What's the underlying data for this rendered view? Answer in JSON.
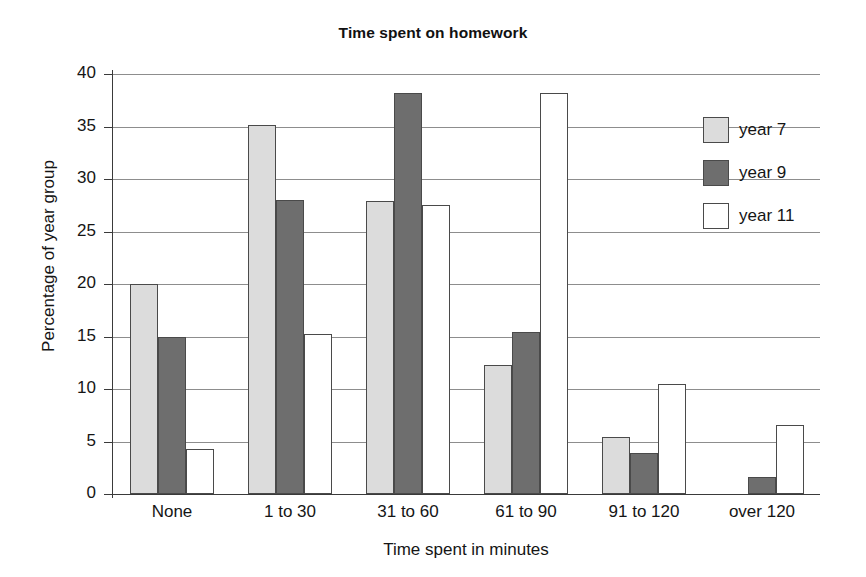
{
  "chart_data": {
    "type": "bar",
    "title": "Time spent on homework",
    "xlabel": "Time spent in minutes",
    "ylabel": "Percentage of year group",
    "categories": [
      "None",
      "1 to 30",
      "31 to 60",
      "61 to 90",
      "91 to 120",
      "over 120"
    ],
    "series": [
      {
        "name": "year 7",
        "color": "#dcdcdc",
        "values": [
          20.0,
          35.1,
          27.9,
          12.3,
          5.4,
          0.0
        ]
      },
      {
        "name": "year 9",
        "color": "#6e6e6e",
        "values": [
          15.0,
          28.0,
          38.2,
          15.4,
          3.9,
          1.6
        ]
      },
      {
        "name": "year 11",
        "color": "#ffffff",
        "values": [
          4.3,
          15.2,
          27.5,
          38.2,
          10.5,
          6.6
        ]
      }
    ],
    "ylim": [
      0,
      40
    ],
    "yticks": [
      0,
      5,
      10,
      15,
      20,
      25,
      30,
      35,
      40
    ],
    "ytick_labels": [
      "0",
      "5",
      "10",
      "15",
      "20",
      "25",
      "30",
      "35",
      "40"
    ],
    "grid": "horizontal",
    "legend_position": "top-right-inside"
  }
}
